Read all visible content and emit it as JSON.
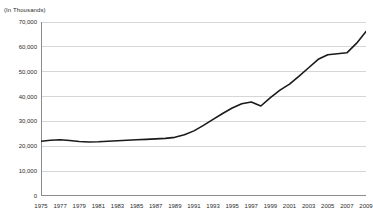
{
  "chart_data": {
    "type": "line",
    "title": "",
    "subtitle": "",
    "units_note": "(In Thousands)",
    "xlabel": "",
    "ylabel": "",
    "ylim": [
      0,
      70000
    ],
    "xlim": [
      1975,
      2009
    ],
    "grid": true,
    "legend": false,
    "legend_position": "none",
    "y_ticks": [
      0,
      10000,
      20000,
      30000,
      40000,
      50000,
      60000,
      70000
    ],
    "y_tick_labels": [
      "0",
      "10,000",
      "20,000",
      "30,000",
      "40,000",
      "50,000",
      "60,000",
      "70,000"
    ],
    "x_ticks": [
      1975,
      1977,
      1979,
      1981,
      1983,
      1985,
      1987,
      1989,
      1991,
      1993,
      1995,
      1997,
      1999,
      2001,
      2003,
      2005,
      2007,
      2009
    ],
    "x_tick_labels": [
      "1975",
      "1977",
      "1979",
      "1981",
      "1983",
      "1985",
      "1987",
      "1989",
      "1991",
      "1993",
      "1995",
      "1997",
      "1999",
      "2001",
      "2003",
      "2005",
      "2007",
      "2009"
    ],
    "x": [
      1975,
      1976,
      1977,
      1978,
      1979,
      1980,
      1981,
      1982,
      1983,
      1984,
      1985,
      1986,
      1987,
      1988,
      1989,
      1990,
      1991,
      1992,
      1993,
      1994,
      1995,
      1996,
      1997,
      1998,
      1999,
      2000,
      2001,
      2002,
      2003,
      2004,
      2005,
      2006,
      2007,
      2008,
      2009
    ],
    "values": [
      22000,
      22400,
      22600,
      22300,
      21900,
      21700,
      21800,
      22000,
      22200,
      22400,
      22600,
      22800,
      23000,
      23200,
      23600,
      24600,
      26200,
      28400,
      30800,
      33200,
      35400,
      37100,
      37800,
      36200,
      39600,
      42600,
      45000,
      48200,
      51600,
      55000,
      56800,
      57200,
      57600,
      61400,
      66200
    ],
    "series_name": "value",
    "line_color": "#1a1a1a",
    "grid_color": "#d6d6d6",
    "axis_color": "#8c8c8c"
  }
}
